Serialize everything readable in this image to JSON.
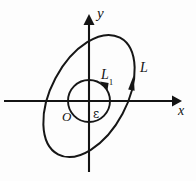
{
  "figure": {
    "kind": "contour-deformation-diagram",
    "background_color": "#fdfdfd",
    "stroke_color": "#161616",
    "axes": {
      "x_axis_label": "x",
      "y_axis_label": "y",
      "origin_label": "O",
      "x_axis_y_px": 101,
      "y_axis_x_px": 89,
      "x_axis_start_px": 4,
      "x_axis_end_px": 176,
      "y_axis_top_px": 18,
      "y_axis_bottom_px": 172
    },
    "curves": [
      {
        "name": "outer-ellipse",
        "label": "L",
        "shape": "ellipse",
        "orientation": "counterclockwise",
        "center_px": [
          89,
          96
        ],
        "radius_x_px": 38,
        "radius_y_px": 66,
        "rotation_deg": 28,
        "arrow_at_px": [
          131,
          85
        ],
        "arrow_direction": "up"
      },
      {
        "name": "inner-circle",
        "label": "L1",
        "label_display": "L",
        "label_subscript": "1",
        "radius_label": "ε",
        "shape": "circle",
        "orientation": "counterclockwise",
        "center_px": [
          89,
          101
        ],
        "radius_px": 21,
        "arrow_at_px": [
          103,
          86
        ],
        "arrow_direction": "counterclockwise"
      }
    ],
    "labels": {
      "y": "y",
      "x": "x",
      "origin": "O",
      "epsilon": "ε",
      "outer_curve": "L",
      "inner_curve": "L",
      "inner_curve_subscript": "1"
    }
  }
}
